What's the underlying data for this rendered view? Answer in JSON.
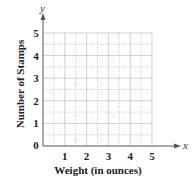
{
  "chart_data": {
    "type": "scatter",
    "title": "",
    "xlabel": "Weight (in ounces)",
    "ylabel": "Number of Stamps",
    "x_axis_variable": "x",
    "y_axis_variable": "y",
    "xlim": [
      0,
      5
    ],
    "ylim": [
      0,
      5
    ],
    "x_ticks": [
      "1",
      "2",
      "3",
      "4",
      "5"
    ],
    "y_ticks": [
      "0",
      "1",
      "2",
      "3",
      "4",
      "5"
    ],
    "grid": true,
    "grid_step": 0.5,
    "series": [],
    "colors": {
      "axis": "#555555",
      "grid": "#bbbbbb",
      "text": "#222222"
    }
  }
}
